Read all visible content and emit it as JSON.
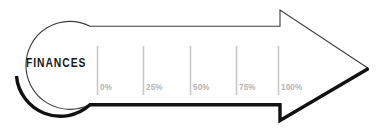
{
  "diagram": {
    "type": "key-shaped-progress-arrow",
    "title_label": "FINANCES",
    "background_color": "#ffffff",
    "outline_thin_color": "#3c3c3c",
    "outline_thick_color": "#111111",
    "label_color": "#171717",
    "tick_color": "#c8c8c8",
    "scale_label_color": "#b4b4b4",
    "scale": {
      "ticks": [
        {
          "label": "0%",
          "x": 97
        },
        {
          "label": "25%",
          "x": 143
        },
        {
          "label": "50%",
          "x": 190
        },
        {
          "label": "75%",
          "x": 236
        },
        {
          "label": "100%",
          "x": 278
        }
      ]
    }
  }
}
